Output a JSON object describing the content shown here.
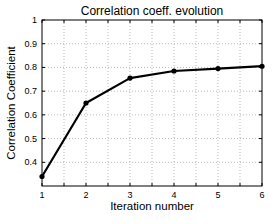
{
  "chart_data": {
    "type": "line",
    "title": "Correlation coeff. evolution",
    "xlabel": "Iteration number",
    "ylabel": "Correlation Coefficient",
    "x": [
      1,
      2,
      3,
      4,
      5,
      6
    ],
    "series": [
      {
        "name": "Correlation Coefficient",
        "values": [
          0.34,
          0.65,
          0.755,
          0.785,
          0.795,
          0.805
        ],
        "color": "#000000",
        "marker": "circle"
      }
    ],
    "xlim": [
      1,
      6
    ],
    "ylim": [
      0.3,
      1.0
    ],
    "xticks": [
      "1",
      "2",
      "3",
      "4",
      "5",
      "6"
    ],
    "yticks": [
      "0.4",
      "0.5",
      "0.6",
      "0.7",
      "0.8",
      "0.9",
      "1"
    ],
    "ytick_values": [
      0.4,
      0.5,
      0.6,
      0.7,
      0.8,
      0.9,
      1.0
    ],
    "grid": true,
    "legend": null
  }
}
